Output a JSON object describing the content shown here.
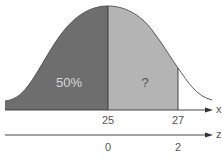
{
  "diagram": {
    "type": "normal-distribution",
    "colors": {
      "left_region": "#6e6e6e",
      "right_region": "#b4b4b4",
      "curve": "#4a4a4a",
      "axis": "#333333",
      "text": "#555555",
      "left_label_text": "#d8d8d8"
    },
    "regions": [
      {
        "id": "left",
        "label": "50%",
        "from": "-inf",
        "to": 25
      },
      {
        "id": "right",
        "label": "?",
        "from": 25,
        "to": 27
      }
    ],
    "x_axis": {
      "name": "x",
      "ticks": [
        {
          "value": "25",
          "pos": 108
        },
        {
          "value": "27",
          "pos": 178
        }
      ]
    },
    "z_axis": {
      "name": "z",
      "ticks": [
        {
          "value": "0",
          "pos": 108
        },
        {
          "value": "2",
          "pos": 178
        }
      ]
    }
  }
}
